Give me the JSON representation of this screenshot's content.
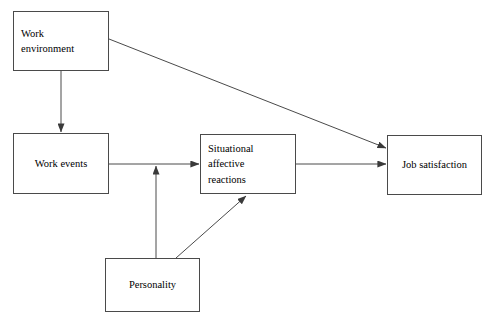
{
  "diagram": {
    "canvas": {
      "width": 493,
      "height": 327,
      "background": "#ffffff"
    },
    "stroke_color": "#4a4a4a",
    "text_color": "#000000",
    "nodes": [
      {
        "id": "work-environment",
        "label": "Work\nenvironment",
        "align": "left",
        "x": 13,
        "y": 11,
        "w": 96,
        "h": 60
      },
      {
        "id": "work-events",
        "label": "Work events",
        "align": "center",
        "x": 13,
        "y": 133,
        "w": 96,
        "h": 61
      },
      {
        "id": "situational-affective-reactions",
        "label": "Situational affective\nreactions",
        "align": "left",
        "x": 200,
        "y": 134,
        "w": 96,
        "h": 60
      },
      {
        "id": "job-satisfaction",
        "label": "Job satisfaction",
        "align": "center",
        "x": 387,
        "y": 135,
        "w": 95,
        "h": 60
      },
      {
        "id": "personality",
        "label": "Personality",
        "align": "center",
        "x": 105,
        "y": 258,
        "w": 95,
        "h": 54
      }
    ],
    "edges": [
      {
        "id": "work-environment-to-work-events",
        "from": "work-environment",
        "to": "work-events",
        "kind": "vertical-arrow"
      },
      {
        "id": "work-environment-to-job-satisfaction",
        "from": "work-environment",
        "to": "job-satisfaction",
        "kind": "diagonal-arrow"
      },
      {
        "id": "work-events-to-situational",
        "from": "work-events",
        "to": "situational-affective-reactions",
        "kind": "horizontal-arrow"
      },
      {
        "id": "situational-to-job-satisfaction",
        "from": "situational-affective-reactions",
        "to": "job-satisfaction",
        "kind": "horizontal-arrow"
      },
      {
        "id": "personality-to-work-events-link",
        "from": "personality",
        "to": "work-events-to-situational",
        "kind": "vertical-arrow"
      },
      {
        "id": "personality-to-situational",
        "from": "personality",
        "to": "situational-affective-reactions",
        "kind": "diagonal-arrow"
      }
    ]
  }
}
